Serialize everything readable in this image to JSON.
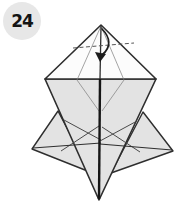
{
  "step_badge": {
    "number": "24"
  },
  "colors": {
    "background": "#ffffff",
    "paper_gray": "#e3e3e3",
    "paper_white": "#fcfcfc",
    "outline": "#2e2e2e",
    "crease_thin": "#7d7d7d",
    "crease_medium": "#4a4a4a",
    "center_edge": "#161616",
    "fold_line": "#555555",
    "arrow": "#1c1c1c",
    "badge_bg": "#e7e7e7",
    "badge_text": "#141414"
  },
  "diagram": {
    "shapes": {
      "left_wing": "58,111 32,149 90,172",
      "right_wing": "143,112 173,151 111,173",
      "body": "45,79 156,79 99,200",
      "top_triangle": "101,25 45,79 156,79"
    },
    "creases": {
      "flap_left": "101,26 77,80 99,111",
      "flap_right": "101,26 124,80 102,111",
      "x1": "M64,120 L101,140",
      "x2": "M61,151 L99,126",
      "x3": "M137,121 L100,141",
      "x4": "M140,152 L102,127",
      "spine_left": "M33,148 L101,143",
      "spine_right": "M172,150 L100,144"
    },
    "edges": {
      "center_upper": "M101,26 L100,79",
      "center_lower": "M100,79 L99,199"
    },
    "fold_line": {
      "path": "M73,48 L134,43",
      "style": "dashed"
    },
    "arrow": {
      "name": "fold-down-arrow",
      "shaft": "M102,29 C110,37 112,47 102,55",
      "head": "100,62 95,52 106,54"
    }
  }
}
